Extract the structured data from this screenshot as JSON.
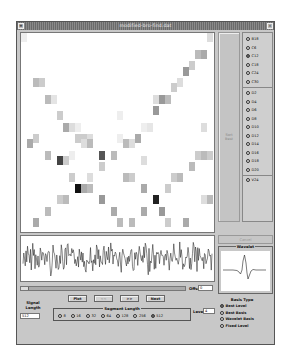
{
  "window": {
    "title": "modified-bro-find.dat",
    "menu_icon": "window-menu-icon",
    "close_icon": "close-icon"
  },
  "right_panel": {
    "sort_label_line1": "Sort",
    "sort_label_line2": "Best",
    "coiflet_options": [
      {
        "label": "B18",
        "selected": false
      },
      {
        "label": "C6",
        "selected": false
      },
      {
        "label": "C12",
        "selected": true
      },
      {
        "label": "C18",
        "selected": false
      },
      {
        "label": "C24",
        "selected": false
      },
      {
        "label": "C30",
        "selected": false
      }
    ],
    "daubechies_options": [
      {
        "label": "D2",
        "selected": false
      },
      {
        "label": "D4",
        "selected": false
      },
      {
        "label": "D6",
        "selected": false
      },
      {
        "label": "D8",
        "selected": false
      },
      {
        "label": "D10",
        "selected": false
      },
      {
        "label": "D12",
        "selected": false
      },
      {
        "label": "D14",
        "selected": false
      },
      {
        "label": "D16",
        "selected": false
      },
      {
        "label": "D18",
        "selected": false
      },
      {
        "label": "D20",
        "selected": false
      }
    ],
    "extra_option": {
      "label": "V24",
      "selected": false
    },
    "disabled_button": "Cancel"
  },
  "wavelet_panel": {
    "title": "Wavelet"
  },
  "controls": {
    "offset_label": "Offset",
    "offset_value": "0",
    "buttons": [
      {
        "label": "Plot",
        "enabled": true
      },
      {
        "label": "<<",
        "enabled": false
      },
      {
        "label": ">>",
        "enabled": true
      },
      {
        "label": "Next",
        "enabled": true
      }
    ],
    "signal_length_label_line1": "Signal",
    "signal_length_label_line2": "Length",
    "signal_length_value": "512",
    "segment_length": {
      "title": "Segment Length",
      "options": [
        {
          "label": "8",
          "selected": false
        },
        {
          "label": "16",
          "selected": false
        },
        {
          "label": "32",
          "selected": false
        },
        {
          "label": "64",
          "selected": false
        },
        {
          "label": "128",
          "selected": false
        },
        {
          "label": "256",
          "selected": false
        },
        {
          "label": "512",
          "selected": true
        }
      ]
    },
    "level_label": "Level",
    "level_value": "4"
  },
  "basis_type": {
    "title": "Basis Type",
    "options": [
      {
        "label": "Best Level",
        "selected": true
      },
      {
        "label": "Best Basis",
        "selected": false
      },
      {
        "label": "Wavelet Basis",
        "selected": false
      },
      {
        "label": "Fixed Level",
        "selected": false
      }
    ]
  },
  "colors": {
    "window_bg": "#c8c8c8",
    "titlebar": "#7a7a7a",
    "plot_bg": "#ffffff",
    "signal_line": "#111111"
  }
}
